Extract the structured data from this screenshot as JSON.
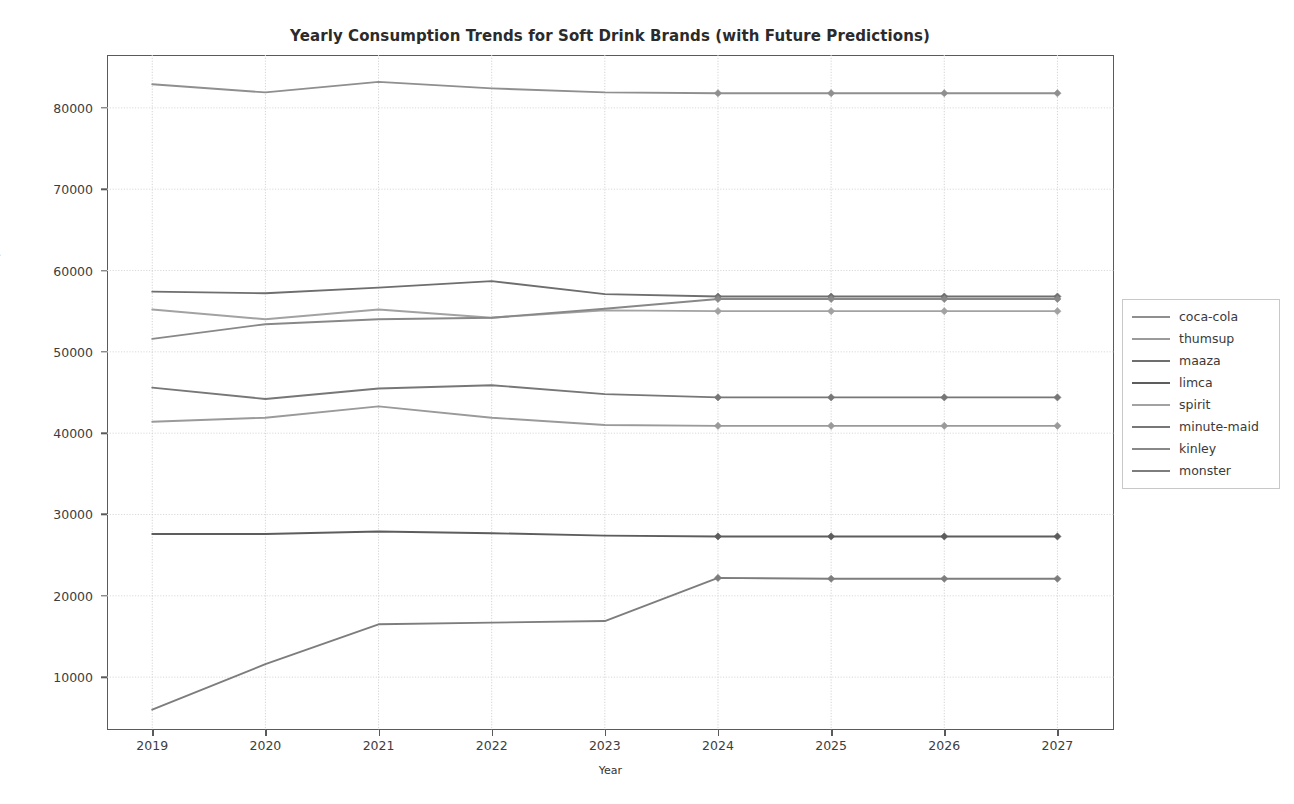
{
  "chart_data": {
    "type": "line",
    "title": "Yearly Consumption Trends for Soft Drink Brands (with Future Predictions)",
    "xlabel": "Year",
    "ylabel": "Consumption",
    "x": [
      2019,
      2020,
      2021,
      2022,
      2023,
      2024,
      2025,
      2026,
      2027
    ],
    "xticklabels": [
      "2019",
      "2020",
      "2021",
      "2022",
      "2023",
      "2024",
      "2025",
      "2026",
      "2027"
    ],
    "yticks": [
      10000,
      20000,
      30000,
      40000,
      50000,
      60000,
      70000,
      80000
    ],
    "yticklabels": [
      "10000",
      "20000",
      "30000",
      "40000",
      "50000",
      "60000",
      "70000",
      "80000"
    ],
    "xlim": [
      2018.6,
      2027.5
    ],
    "ylim": [
      3500,
      86500
    ],
    "grid": true,
    "legend_position": "right",
    "prediction_start_year": 2024,
    "marker": "diamond",
    "series": [
      {
        "name": "coca-cola",
        "color": "#8f8f8f",
        "values": [
          82900,
          81900,
          83200,
          82400,
          81900,
          81800,
          81800,
          81800,
          81800
        ]
      },
      {
        "name": "thumsup",
        "color": "#9a9a9a",
        "values": [
          41400,
          41900,
          43300,
          41900,
          41000,
          40900,
          40900,
          40900,
          40900
        ]
      },
      {
        "name": "maaza",
        "color": "#6e6e6e",
        "values": [
          57400,
          57200,
          57900,
          58700,
          57100,
          56800,
          56800,
          56800,
          56800
        ]
      },
      {
        "name": "limca",
        "color": "#5d5d5d",
        "values": [
          27600,
          27600,
          27900,
          27700,
          27400,
          27300,
          27300,
          27300,
          27300
        ]
      },
      {
        "name": "spirit",
        "color": "#a2a2a2",
        "values": [
          55200,
          54000,
          55200,
          54200,
          55100,
          55000,
          55000,
          55000,
          55000
        ]
      },
      {
        "name": "minute-maid",
        "color": "#777777",
        "values": [
          45600,
          44200,
          45500,
          45900,
          44800,
          44400,
          44400,
          44400,
          44400
        ]
      },
      {
        "name": "kinley",
        "color": "#888888",
        "values": [
          51600,
          53400,
          54000,
          54200,
          55300,
          56500,
          56500,
          56500,
          56500
        ]
      },
      {
        "name": "monster",
        "color": "#7d7d7d",
        "values": [
          6000,
          11600,
          16500,
          16700,
          16900,
          22200,
          22100,
          22100,
          22100
        ]
      }
    ]
  }
}
